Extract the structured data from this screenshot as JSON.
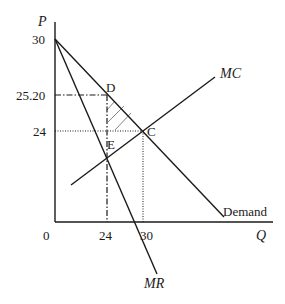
{
  "figure": {
    "type": "monopoly-deadweight-loss-diagram",
    "axes": {
      "y_label": "P",
      "x_label": "Q",
      "origin_label": "0",
      "y_ticks": [
        "30",
        "25.20",
        "24"
      ],
      "x_ticks": [
        "24",
        "30"
      ]
    },
    "curves": {
      "demand_label": "Demand",
      "mr_label": "MR",
      "mc_label": "MC"
    },
    "points": {
      "d_label": "D",
      "c_label": "C",
      "e_label": "E"
    },
    "values": {
      "p_intercept": 30,
      "monopoly_price": 25.2,
      "competitive_price": 24,
      "monopoly_quantity": 24,
      "competitive_quantity": 30
    },
    "colors": {
      "line": "#1a1a1a",
      "background": "#ffffff"
    }
  }
}
